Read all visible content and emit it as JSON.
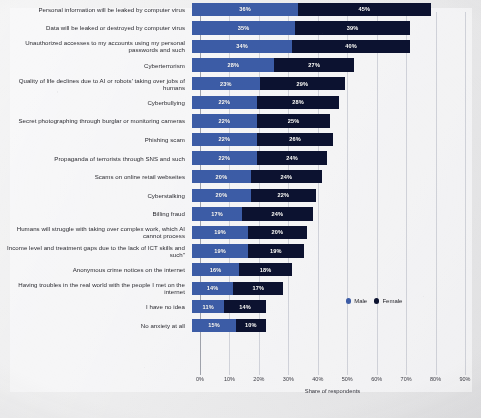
{
  "chart_data": {
    "type": "bar",
    "orientation": "horizontal",
    "stacked": true,
    "title": "",
    "xlabel": "Share of respondents",
    "ylabel": "",
    "xlim": [
      0,
      90
    ],
    "xticks": [
      "0%",
      "10%",
      "20%",
      "30%",
      "40%",
      "50%",
      "60%",
      "70%",
      "80%",
      "90%"
    ],
    "grid": true,
    "legend_position": "right",
    "value_suffix": "%",
    "colors": {
      "male": "#3c5ca6",
      "female": "#0c1230",
      "background": "#e9e9ea",
      "text": "#2a2a30"
    },
    "legend": [
      {
        "name": "Male",
        "color": "#3c5ca6"
      },
      {
        "name": "Female",
        "color": "#0c1230"
      }
    ],
    "categories": [
      "Personal information will be leaked by computer virus",
      "Data will be leaked or destroyed by computer virus",
      "Unauthorized accesses to my accounts using my personal passwords and such",
      "Cyberterrorism",
      "Quality of life declines due to AI or robots' taking over jobs of humans",
      "Cyberbullying",
      "Secret photographing through burglar or monitoring cameras",
      "Phishing scam",
      "Propaganda of terrorists through SNS and such",
      "Scams on online retail webseites",
      "Cyberstalking",
      "Billing fraud",
      "Humans will struggle with taking over complex work, which AI cannot process",
      "Income level and treatment gaps due to the lack of ICT skills and such\"",
      "Anonymous crime notices on the internet",
      "Having troubles in the real world with the people I met on the internet",
      "I have no idea",
      "No anxiety at all"
    ],
    "series": [
      {
        "name": "Male",
        "color": "#3c5ca6",
        "values": [
          36,
          35,
          34,
          28,
          23,
          22,
          22,
          22,
          22,
          20,
          20,
          17,
          19,
          19,
          16,
          14,
          11,
          15
        ]
      },
      {
        "name": "Female",
        "color": "#0c1230",
        "values": [
          45,
          39,
          40,
          27,
          29,
          28,
          25,
          26,
          24,
          24,
          22,
          24,
          20,
          19,
          18,
          17,
          14,
          10
        ]
      }
    ],
    "labels": {
      "male": [
        "36%",
        "35%",
        "34%",
        "28%",
        "23%",
        "22%",
        "22%",
        "22%",
        "22%",
        "20%",
        "20%",
        "17%",
        "19%",
        "19%",
        "16%",
        "14%",
        "11%",
        "15%"
      ],
      "female": [
        "45%",
        "39%",
        "40%",
        "27%",
        "29%",
        "28%",
        "25%",
        "26%",
        "24%",
        "24%",
        "22%",
        "24%",
        "20%",
        "19%",
        "18%",
        "17%",
        "14%",
        "10%"
      ]
    }
  }
}
